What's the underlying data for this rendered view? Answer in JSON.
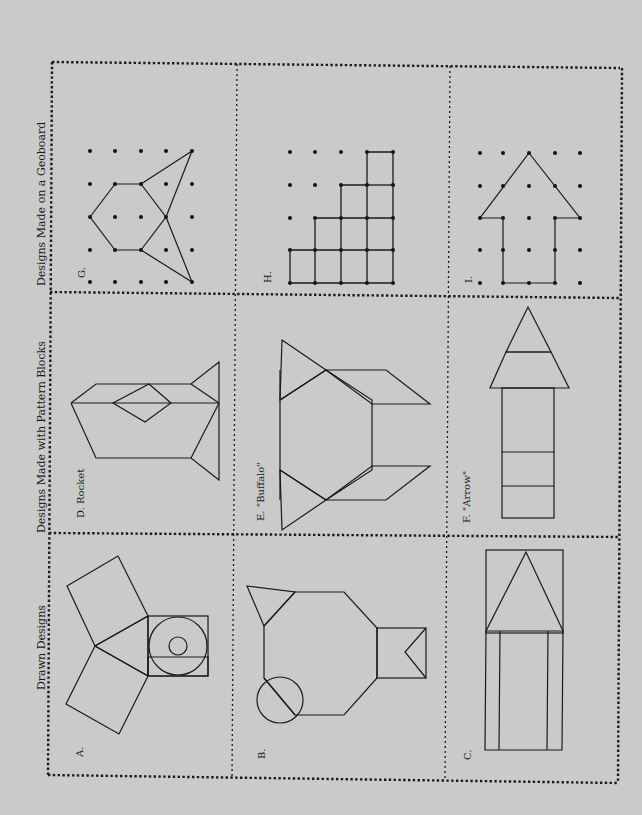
{
  "worksheet": {
    "orientation": "rotated 90 degrees counter-clockwise",
    "colors": {
      "background": "#cacaca",
      "ink": "#1a1a1a"
    },
    "sections": [
      {
        "title": "Drawn Designs",
        "items": [
          {
            "label": "A.",
            "figure": "three squares around a triangle with a square containing concentric circles"
          },
          {
            "label": "B.",
            "figure": "octagon body with triangle, circle with diagonal, square with notch"
          },
          {
            "label": "C.",
            "figure": "rectangle with triangle on top and two inner vertical lines"
          }
        ]
      },
      {
        "title": "Designs Made with Pattern Blocks",
        "items": [
          {
            "label": "D. Rocket",
            "figure": "rhombi and triangles forming a rocket"
          },
          {
            "label": "E. \"Buffalo\"",
            "figure": "hexagon with triangles and rhombi"
          },
          {
            "label": "F. \"Arrow\"",
            "figure": "three squares topped with trapezoid and triangle"
          }
        ]
      },
      {
        "title": "Designs Made on a Geoboard",
        "items": [
          {
            "label": "G.",
            "figure": "hexagon and triangles on 5x5 pegs"
          },
          {
            "label": "H.",
            "figure": "staircase of unit squares on 5x5 pegs"
          },
          {
            "label": "I.",
            "figure": "arrow shape on 5x5 pegs"
          }
        ]
      }
    ]
  }
}
